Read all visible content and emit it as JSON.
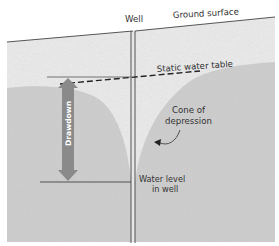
{
  "diagram": {
    "type": "cross-section",
    "labels": {
      "well": "Well",
      "ground_surface": "Ground surface",
      "static_water_table": "Static water table",
      "cone_line1": "Cone of",
      "cone_line2": "depression",
      "drawdown": "Drawdown",
      "water_level_line1": "Water level",
      "water_level_line2": "in well"
    },
    "colors": {
      "unsaturated_zone": "#ececec",
      "saturated_zone": "#cfcfcf",
      "drawdown_arrow": "#8a8a8a",
      "lines": "#444444",
      "background": "#ffffff"
    }
  }
}
